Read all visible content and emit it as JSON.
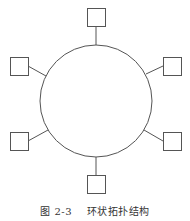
{
  "caption": {
    "figure_number": "图 2-3",
    "title": "环状拓扑结构"
  },
  "diagram": {
    "type": "ring-topology",
    "stroke_color": "#555555",
    "ring": {
      "cx": 96,
      "cy": 101,
      "r": 56
    },
    "nodes": [
      {
        "id": "node-top",
        "x": 87,
        "y": 8,
        "w": 18,
        "h": 18,
        "lx1": 96,
        "ly1": 26,
        "lx2": 96,
        "ly2": 45
      },
      {
        "id": "node-upper-left",
        "x": 10,
        "y": 57,
        "w": 18,
        "h": 18,
        "lx1": 28,
        "ly1": 66,
        "lx2": 46,
        "ly2": 76
      },
      {
        "id": "node-upper-right",
        "x": 163,
        "y": 57,
        "w": 18,
        "h": 18,
        "lx1": 163,
        "ly1": 66,
        "lx2": 146,
        "ly2": 74
      },
      {
        "id": "node-lower-left",
        "x": 10,
        "y": 132,
        "w": 18,
        "h": 18,
        "lx1": 28,
        "ly1": 141,
        "lx2": 48,
        "ly2": 130
      },
      {
        "id": "node-lower-right",
        "x": 163,
        "y": 132,
        "w": 18,
        "h": 18,
        "lx1": 163,
        "ly1": 141,
        "lx2": 144,
        "ly2": 130
      },
      {
        "id": "node-bottom",
        "x": 87,
        "y": 175,
        "w": 18,
        "h": 18,
        "lx1": 96,
        "ly1": 157,
        "lx2": 96,
        "ly2": 175
      }
    ]
  }
}
